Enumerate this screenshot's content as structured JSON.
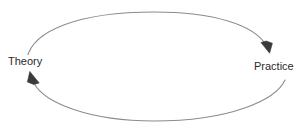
{
  "diagram": {
    "type": "cycle",
    "title": "",
    "background_color": "#ffffff",
    "stroke_color": "#8c8c8c",
    "arrowhead_color": "#3a3a3a",
    "text_color": "#2b2b2b",
    "nodes": [
      {
        "id": "theory",
        "label": "Theory"
      },
      {
        "id": "practice",
        "label": "Practice"
      }
    ],
    "edges": [
      {
        "id": "theory-to-practice",
        "from": "Theory",
        "to": "Practice",
        "label": "",
        "direction": "clockwise-top",
        "arrowhead": "filled-triangle"
      },
      {
        "id": "practice-to-theory",
        "from": "Practice",
        "to": "Theory",
        "label": "",
        "direction": "clockwise-bottom",
        "arrowhead": "filled-triangle"
      }
    ]
  }
}
